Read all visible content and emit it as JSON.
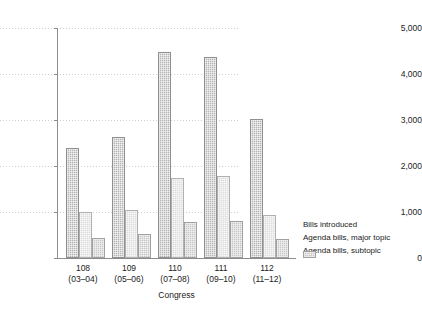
{
  "chart_data": {
    "type": "bar",
    "title": "",
    "subtitle": "",
    "xlabel": "Congress",
    "ylabel": "",
    "ylim": [
      0,
      5000
    ],
    "yticks": [
      0,
      1000,
      2000,
      3000,
      4000,
      5000
    ],
    "ytick_labels": [
      "0",
      "1,000",
      "2,000",
      "3,000",
      "4,000",
      "5,000"
    ],
    "grid": true,
    "legend_position": "right",
    "categories": [
      "108",
      "109",
      "110",
      "111",
      "112"
    ],
    "category_sublabels": [
      "(03–04)",
      "(05–06)",
      "(07–08)",
      "(09–10)",
      "(11–12)"
    ],
    "series": [
      {
        "name": "Bills introduced",
        "color": "#b4b4b4",
        "values": [
          2400,
          2620,
          4480,
          4360,
          3030
        ]
      },
      {
        "name": "Agenda bills, major topic",
        "color": "#dcdcdc",
        "values": [
          1000,
          1050,
          1730,
          1780,
          930
        ]
      },
      {
        "name": "Agenda bills, subtopic",
        "color": "#c6c6c6",
        "values": [
          430,
          520,
          780,
          800,
          420
        ]
      }
    ]
  },
  "axis": {
    "x_title": "Congress"
  },
  "legend": {
    "items": [
      {
        "label": "Bills introduced"
      },
      {
        "label": "Agenda bills, major topic"
      },
      {
        "label": "Agenda bills, subtopic"
      }
    ]
  }
}
